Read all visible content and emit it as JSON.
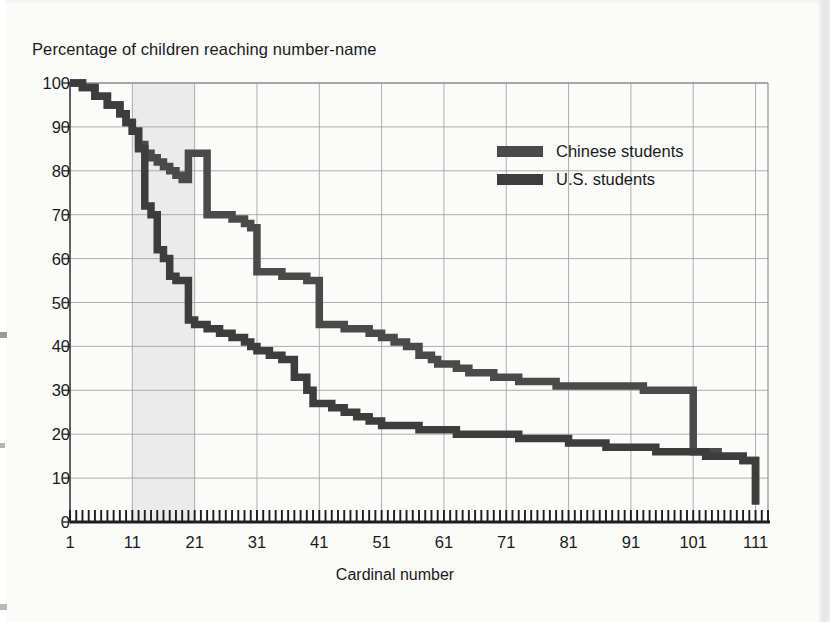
{
  "chart_data": {
    "type": "line",
    "title": "Percentage of children reaching number-name",
    "xlabel": "Cardinal number",
    "ylabel": "",
    "xlim": [
      1,
      113
    ],
    "ylim": [
      0,
      100
    ],
    "grid": true,
    "legend_position": "inside-upper-right",
    "xticks": [
      1,
      11,
      21,
      31,
      41,
      51,
      61,
      71,
      81,
      91,
      101,
      111
    ],
    "yticks": [
      0,
      10,
      20,
      30,
      40,
      50,
      60,
      70,
      80,
      90,
      100
    ],
    "minor_xticks_every": 1,
    "highlight_band": {
      "label": "teens region",
      "x_start": 11,
      "x_end": 21,
      "color": "#ebebeb"
    },
    "series": [
      {
        "name": "Chinese students",
        "color": "#4a4a4a",
        "x": [
          1,
          3,
          5,
          7,
          9,
          10,
          11,
          12,
          13,
          14,
          15,
          16,
          17,
          18,
          19,
          20,
          21,
          23,
          25,
          27,
          29,
          30,
          31,
          33,
          35,
          37,
          39,
          40,
          41,
          43,
          45,
          47,
          49,
          50,
          51,
          53,
          55,
          57,
          59,
          60,
          61,
          63,
          65,
          67,
          69,
          71,
          73,
          75,
          77,
          79,
          81,
          83,
          85,
          87,
          89,
          91,
          93,
          95,
          97,
          99,
          100,
          101,
          103,
          105,
          107,
          109,
          110,
          111
        ],
        "y": [
          100,
          99,
          97,
          95,
          93,
          91,
          89,
          86,
          84,
          83,
          82,
          81,
          80,
          79,
          78,
          84,
          84,
          70,
          70,
          69,
          68,
          67,
          57,
          57,
          56,
          56,
          55,
          55,
          45,
          45,
          44,
          44,
          43,
          43,
          42,
          41,
          40,
          38,
          37,
          36,
          36,
          35,
          34,
          34,
          33,
          33,
          32,
          32,
          32,
          31,
          31,
          31,
          31,
          31,
          31,
          31,
          30,
          30,
          30,
          30,
          30,
          16,
          16,
          15,
          15,
          14,
          14,
          4
        ]
      },
      {
        "name": "U.S. students",
        "color": "#3d3d3d",
        "x": [
          1,
          3,
          5,
          7,
          9,
          10,
          11,
          12,
          13,
          14,
          15,
          16,
          17,
          18,
          19,
          20,
          21,
          23,
          25,
          27,
          29,
          30,
          31,
          33,
          35,
          37,
          39,
          40,
          41,
          43,
          45,
          47,
          49,
          50,
          51,
          53,
          55,
          57,
          59,
          60,
          61,
          63,
          65,
          67,
          69,
          71,
          73,
          75,
          77,
          79,
          81,
          83,
          85,
          87,
          89,
          91,
          93,
          95,
          97,
          99,
          100,
          101,
          103,
          105,
          107,
          109,
          110,
          111
        ],
        "y": [
          100,
          99,
          97,
          95,
          93,
          91,
          89,
          85,
          72,
          70,
          62,
          60,
          56,
          55,
          55,
          46,
          45,
          44,
          43,
          42,
          41,
          40,
          39,
          38,
          37,
          33,
          30,
          27,
          27,
          26,
          25,
          24,
          23,
          23,
          22,
          22,
          22,
          21,
          21,
          21,
          21,
          20,
          20,
          20,
          20,
          20,
          19,
          19,
          19,
          19,
          18,
          18,
          18,
          17,
          17,
          17,
          17,
          16,
          16,
          16,
          16,
          16,
          15,
          15,
          15,
          14,
          14,
          4
        ]
      }
    ]
  },
  "legend": {
    "items": [
      {
        "label": "Chinese students",
        "color": "#4a4a4a"
      },
      {
        "label": "U.S. students",
        "color": "#3d3d3d"
      }
    ]
  },
  "axis": {
    "y_labels": [
      "100",
      "90",
      "80",
      "70",
      "60",
      "50",
      "40",
      "30",
      "20",
      "10",
      "0"
    ],
    "x_labels": [
      "1",
      "11",
      "21",
      "31",
      "41",
      "51",
      "61",
      "71",
      "81",
      "91",
      "101",
      "111"
    ]
  }
}
